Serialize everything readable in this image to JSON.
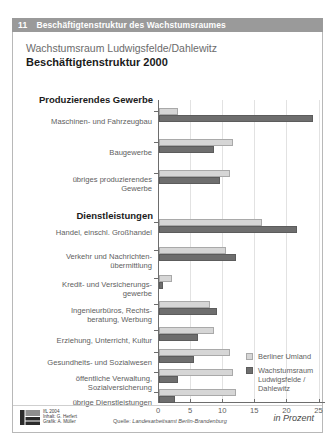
{
  "header": {
    "number": "11",
    "title": "Beschäftigtenstruktur des Wachstumsraumes"
  },
  "titles": {
    "supertitle": "Wachstumsraum Ludwigsfelde/Dahlewitz",
    "maintitle": "Beschäftigtenstruktur 2000"
  },
  "groups": [
    {
      "label": "Produzierendes Gewerbe"
    },
    {
      "label": "Dienstleistungen"
    }
  ],
  "legend": {
    "items": [
      {
        "label": "Berliner Umland",
        "color": "#d6d6d6"
      },
      {
        "label": "Wachstumsraum\nLudwigsfelde /\nDahlewitz",
        "color": "#6e6e6e"
      }
    ],
    "line1": "Berliner Umland",
    "line2a": "Wachstumsraum",
    "line2b": "Ludwigsfelde /",
    "line2c": "Dahlewitz"
  },
  "unit_note": "in Prozent",
  "footer": {
    "logo_alt": "ifl-logo",
    "credit_year": "IfL 2004",
    "credit_content": "Inhalt: G. Herfert",
    "credit_graphic": "Grafik: A. Müller",
    "source_label": "Quelle:",
    "source_text": "Landesarbeitsamt Berlin-Brandenburg"
  },
  "chart_data": {
    "type": "bar",
    "orientation": "horizontal",
    "title": "Beschäftigtenstruktur 2000",
    "subtitle": "Wachstumsraum Ludwigsfelde/Dahlewitz",
    "xlabel": "in Prozent",
    "ylabel": "",
    "xlim": [
      0,
      26
    ],
    "xticks": [
      0,
      5,
      10,
      15,
      20,
      25
    ],
    "xticklabels": [
      "0",
      "5",
      "10",
      "15",
      "20",
      "25"
    ],
    "grid": true,
    "legend_position": "bottom-right",
    "sections": [
      {
        "name": "Produzierendes Gewerbe",
        "categories": [
          "Maschinen- und Fahrzeugbau",
          "Baugewerbe",
          "übriges produzierendes Gewerbe"
        ]
      },
      {
        "name": "Dienstleistungen",
        "categories": [
          "Handel, einschl. Großhandel",
          "Verkehr und Nachrichtenübermittlung",
          "Kredit- und Versicherungsgewerbe",
          "Ingenieurbüros, Rechtsberatung, Werbung",
          "Erziehung, Unterricht, Kultur",
          "Gesundheits- und Sozialwesen",
          "öffentliche Verwaltung, Sozialversicherung",
          "übrige Dienstleistungen"
        ]
      }
    ],
    "categories": [
      "Maschinen- und Fahrzeugbau",
      "Baugewerbe",
      "übriges produzierendes Gewerbe",
      "Handel, einschl. Großhandel",
      "Verkehr und Nachrichtenübermittlung",
      "Kredit- und Versicherungsgewerbe",
      "Ingenieurbüros, Rechtsberatung, Werbung",
      "Erziehung, Unterricht, Kultur",
      "Gesundheits- und Sozialwesen",
      "öffentliche Verwaltung, Sozialversicherung",
      "übrige Dienstleistungen"
    ],
    "series": [
      {
        "name": "Berliner Umland",
        "color": "#d6d6d6",
        "values": [
          3.0,
          11.5,
          11.0,
          16.0,
          10.5,
          2.0,
          8.0,
          8.5,
          11.0,
          11.5,
          12.0
        ]
      },
      {
        "name": "Wachstumsraum Ludwigsfelde / Dahlewitz",
        "color": "#6e6e6e",
        "values": [
          24.0,
          8.5,
          9.5,
          21.5,
          12.0,
          0.6,
          9.0,
          6.0,
          5.5,
          3.0,
          2.5
        ]
      }
    ]
  },
  "rows": [
    {
      "label_lines": [
        "Maschinen- und Fahrzeugbau"
      ],
      "light": 3.0,
      "dark": 24.0
    },
    {
      "label_lines": [
        "Baugewerbe"
      ],
      "light": 11.5,
      "dark": 8.5
    },
    {
      "label_lines": [
        "übriges produzierendes",
        "Gewerbe"
      ],
      "light": 11.0,
      "dark": 9.5
    },
    {
      "label_lines": [
        "Handel, einschl. Großhandel"
      ],
      "light": 16.0,
      "dark": 21.5
    },
    {
      "label_lines": [
        "Verkehr und Nachrichten-",
        "übermittlung"
      ],
      "light": 10.5,
      "dark": 12.0
    },
    {
      "label_lines": [
        "Kredit- und Versicherungs-",
        "gewerbe"
      ],
      "light": 2.0,
      "dark": 0.6
    },
    {
      "label_lines": [
        "Ingenieurbüros, Rechts-",
        "beratung, Werbung"
      ],
      "light": 8.0,
      "dark": 9.0
    },
    {
      "label_lines": [
        "Erziehung, Unterricht, Kultur"
      ],
      "light": 8.5,
      "dark": 6.0
    },
    {
      "label_lines": [
        "Gesundheits- und Sozialwesen"
      ],
      "light": 11.0,
      "dark": 5.5
    },
    {
      "label_lines": [
        "öffentliche Verwaltung,",
        "Sozialversicherung"
      ],
      "light": 11.5,
      "dark": 3.0
    },
    {
      "label_lines": [
        "übrige Dienstleistungen"
      ],
      "light": 12.0,
      "dark": 2.5
    }
  ]
}
